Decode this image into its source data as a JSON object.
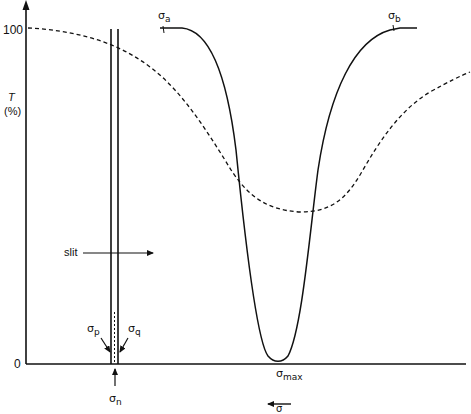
{
  "figure": {
    "y_axis": {
      "label_line1": "T",
      "label_line2": "(%)",
      "tick_top": "100",
      "tick_bottom": "0"
    },
    "x_axis": {
      "direction_label_symbol": "σ",
      "direction": "decreasing to the left"
    },
    "labels": {
      "slit": "slit",
      "sigma_a": {
        "symbol": "σ",
        "sub": "a"
      },
      "sigma_b": {
        "symbol": "σ",
        "sub": "b"
      },
      "sigma_p": {
        "symbol": "σ",
        "sub": "p"
      },
      "sigma_q": {
        "symbol": "σ",
        "sub": "q"
      },
      "sigma_n": {
        "symbol": "σ",
        "sub": "n"
      },
      "sigma_max": {
        "symbol": "σ",
        "sub": "max"
      }
    },
    "curves": [
      {
        "name": "true absorption band",
        "style": "solid"
      },
      {
        "name": "observed band (slit-broadened)",
        "style": "dashed"
      }
    ],
    "colors": {
      "ink": "#111111",
      "background": "#ffffff"
    }
  }
}
